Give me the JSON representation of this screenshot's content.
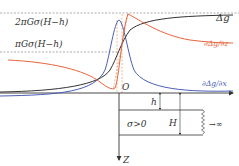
{
  "figure": {
    "levels": {
      "upper": "2πGσ(H−h)",
      "middle": "πGσ(H−h)"
    },
    "curves": {
      "gravity": "Δg",
      "horizontal_derivative": "∂Δg/∂z",
      "vertical_derivative": "∂Δg/∂x"
    },
    "axes": {
      "origin": "O",
      "depth": "Z"
    },
    "body": {
      "top_depth": "h",
      "bottom_depth": "H",
      "density": "σ>0",
      "extent": "→∞"
    },
    "colors": {
      "gravity": "#333333",
      "horizontal_derivative": "#e8643c",
      "vertical_derivative": "#4a5fb5",
      "dashed_helper": "#e0a070",
      "reference_lines": "#888888"
    }
  }
}
